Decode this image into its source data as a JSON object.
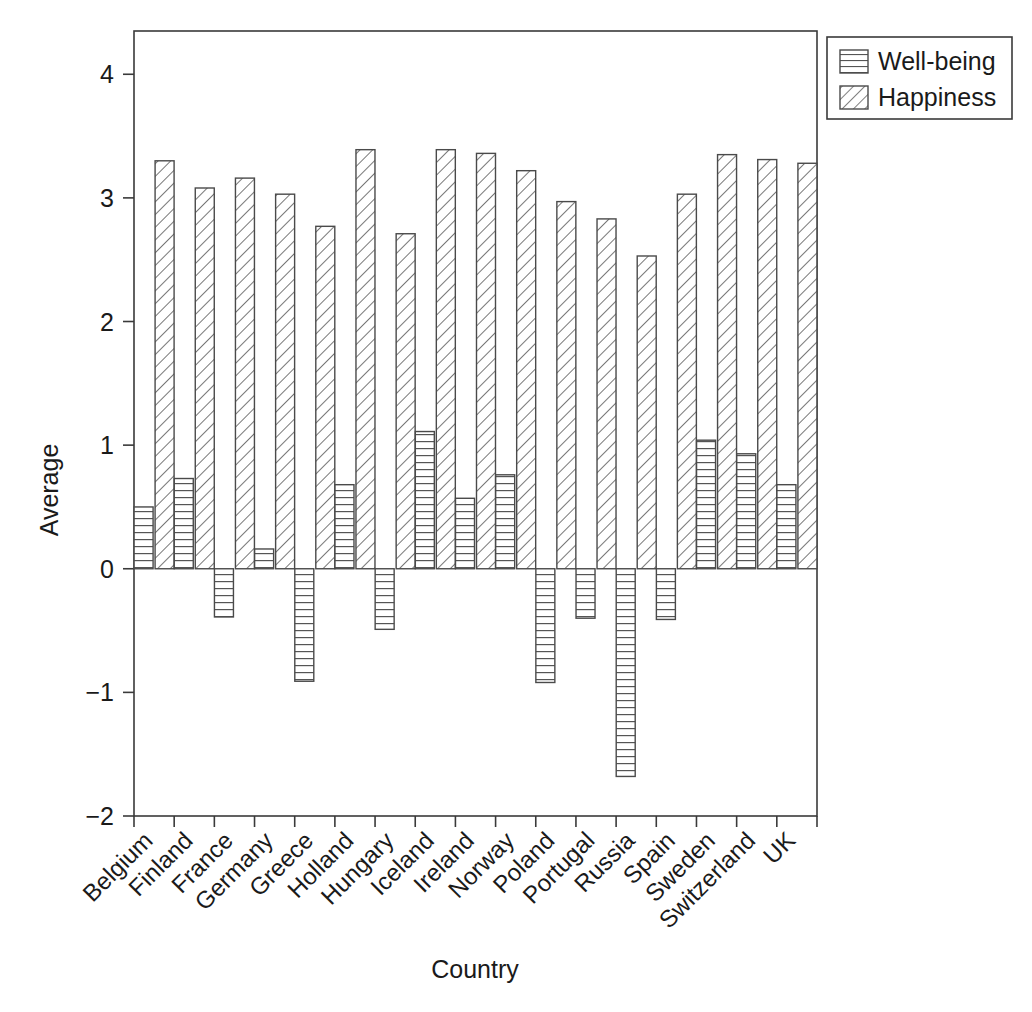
{
  "chart_data": {
    "type": "bar",
    "title": "",
    "xlabel": "Country",
    "ylabel": "Average",
    "ylim": [
      -2,
      4.35
    ],
    "yticks": [
      -2,
      -1,
      0,
      1,
      2,
      3,
      4
    ],
    "ytick_labels": [
      "−2",
      "−1",
      "0",
      "1",
      "2",
      "3",
      "4"
    ],
    "grid": false,
    "legend_position": "top-right-outside",
    "categories": [
      "Belgium",
      "Finland",
      "France",
      "Germany",
      "Greece",
      "Holland",
      "Hungary",
      "Iceland",
      "Ireland",
      "Norway",
      "Poland",
      "Portugal",
      "Russia",
      "Spain",
      "Sweden",
      "Switzerland",
      "UK"
    ],
    "series": [
      {
        "name": "Well-being",
        "pattern": "horizontal-lines",
        "values": [
          0.5,
          0.73,
          -0.39,
          0.16,
          -0.91,
          0.68,
          -0.49,
          1.11,
          0.57,
          0.76,
          -0.92,
          -0.4,
          -1.68,
          -0.41,
          1.04,
          0.93,
          0.68
        ]
      },
      {
        "name": "Happiness",
        "pattern": "diagonal-hatch",
        "values": [
          3.3,
          3.08,
          3.16,
          3.03,
          2.77,
          3.39,
          2.71,
          3.39,
          3.36,
          3.22,
          2.97,
          2.83,
          2.53,
          3.03,
          3.35,
          3.31,
          3.28
        ]
      }
    ]
  },
  "legend": {
    "entries": [
      {
        "label": "Well-being"
      },
      {
        "label": "Happiness"
      }
    ]
  },
  "colors": {
    "axis": "#3a3a3a",
    "bar_edge": "#4a4a4a",
    "bar_fill": "#ffffff",
    "text": "#1a1a1a",
    "background": "#ffffff"
  }
}
